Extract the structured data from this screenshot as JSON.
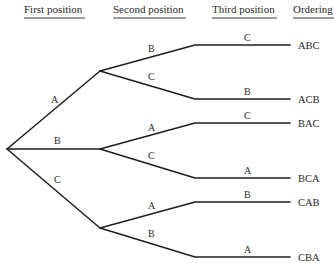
{
  "headers": [
    {
      "id": "first",
      "label": "First position",
      "x": 24,
      "x1": 24,
      "x2": 85
    },
    {
      "id": "second",
      "label": "Second position",
      "x": 113,
      "x1": 113,
      "x2": 186
    },
    {
      "id": "third",
      "label": "Third position",
      "x": 212,
      "x1": 212,
      "x2": 277
    },
    {
      "id": "ordering",
      "label": "Ordering",
      "x": 293,
      "x1": 293,
      "x2": 334
    }
  ],
  "header_y": 13,
  "header_line_y": 18,
  "root": {
    "x": 7,
    "y": 149
  },
  "level1": [
    {
      "label": "A",
      "node": {
        "x": 100,
        "y": 71
      },
      "label_pos": {
        "x": 51,
        "y": 103
      }
    },
    {
      "label": "B",
      "node": {
        "x": 100,
        "y": 149
      },
      "label_pos": {
        "x": 54,
        "y": 144
      }
    },
    {
      "label": "C",
      "node": {
        "x": 100,
        "y": 228
      },
      "label_pos": {
        "x": 54,
        "y": 183
      }
    }
  ],
  "level2": [
    {
      "parent": 0,
      "label": "B",
      "bend": {
        "x": 195,
        "y": 45
      },
      "label_pos": {
        "x": 148,
        "y": 52
      }
    },
    {
      "parent": 0,
      "label": "C",
      "bend": {
        "x": 195,
        "y": 99
      },
      "label_pos": {
        "x": 148,
        "y": 80
      }
    },
    {
      "parent": 1,
      "label": "A",
      "bend": {
        "x": 195,
        "y": 123
      },
      "label_pos": {
        "x": 148,
        "y": 131
      }
    },
    {
      "parent": 1,
      "label": "C",
      "bend": {
        "x": 195,
        "y": 178
      },
      "label_pos": {
        "x": 148,
        "y": 159
      }
    },
    {
      "parent": 2,
      "label": "A",
      "bend": {
        "x": 195,
        "y": 202
      },
      "label_pos": {
        "x": 148,
        "y": 209
      }
    },
    {
      "parent": 2,
      "label": "B",
      "bend": {
        "x": 195,
        "y": 257
      },
      "label_pos": {
        "x": 148,
        "y": 237
      }
    }
  ],
  "level3": [
    {
      "label": "C",
      "end_x": 290,
      "label_x": 244,
      "ordering": "ABC"
    },
    {
      "label": "B",
      "end_x": 290,
      "label_x": 244,
      "ordering": "ACB"
    },
    {
      "label": "C",
      "end_x": 290,
      "label_x": 244,
      "ordering": "BAC"
    },
    {
      "label": "A",
      "end_x": 290,
      "label_x": 244,
      "ordering": "BCA"
    },
    {
      "label": "B",
      "end_x": 290,
      "label_x": 244,
      "ordering": "CAB"
    },
    {
      "label": "A",
      "end_x": 290,
      "label_x": 244,
      "ordering": "CBA"
    }
  ],
  "ordering_x": 298
}
